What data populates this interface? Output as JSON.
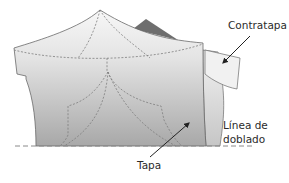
{
  "diagram": {
    "labels": {
      "facing": "Contratapa",
      "fold_line_1": "Línea de",
      "fold_line_2": "doblado",
      "front": "Tapa"
    },
    "colors": {
      "piece_top": "#f4f4f4",
      "piece_bottom": "#a9a9a9",
      "back_piece": "#6e6e6e",
      "outline": "#6a6a6a",
      "dashed": "#808080",
      "arrow": "#222222",
      "text": "#2b2b2b"
    }
  }
}
